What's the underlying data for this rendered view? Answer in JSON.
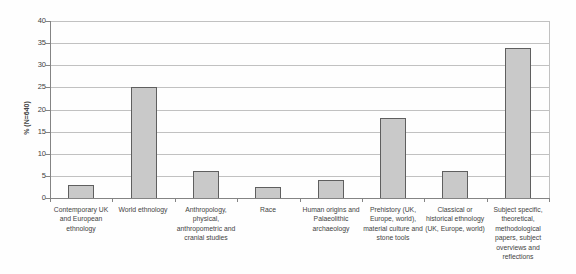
{
  "chart_data": {
    "type": "bar",
    "title": "",
    "xlabel": "",
    "ylabel": "% (N=640)",
    "categories": [
      "Contemporary UK and European ethnology",
      "World ethnology",
      "Anthropology, physical, anthropometric and cranial studies",
      "Race",
      "Human origins and Palaeolithic archaeology",
      "Prehistory (UK, Europe, world), material culture and stone tools",
      "Classical or historical ethnology (UK, Europe, world)",
      "Subject specific, theoretical, methodological papers, subject overviews and reflections"
    ],
    "values": [
      3,
      25,
      6,
      2.5,
      4,
      18,
      6,
      34
    ],
    "ylim": [
      0,
      40
    ],
    "yticks": [
      0,
      5,
      10,
      15,
      20,
      25,
      30,
      35,
      40
    ],
    "grid": true,
    "legend": "none",
    "series_count": 1
  },
  "colors": {
    "background": "#fefefe",
    "bar_fill": "#c9c9c9",
    "bar_border": "#5f5f5f",
    "gridline": "#c1c1c1",
    "axis": "#848484",
    "text": "#434343"
  }
}
